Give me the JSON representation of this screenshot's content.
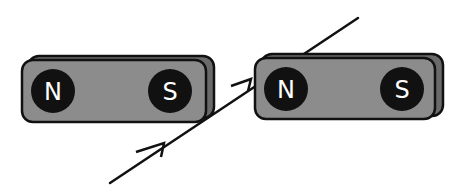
{
  "diagram": {
    "type": "bar-magnets-field-line",
    "magnets": [
      {
        "id": "magnet-left",
        "poles": [
          {
            "label": "N"
          },
          {
            "label": "S"
          }
        ]
      },
      {
        "id": "magnet-right",
        "poles": [
          {
            "label": "N"
          },
          {
            "label": "S"
          }
        ]
      }
    ],
    "field_line": {
      "direction": "up-right",
      "arrowheads": 2
    },
    "colors": {
      "magnet_body": "#8a8a8a",
      "magnet_side": "#6a6a6a",
      "outline": "#111111",
      "pole_fill": "#111111",
      "pole_text": "#ffffff",
      "line": "#111111",
      "background": "#ffffff"
    }
  }
}
